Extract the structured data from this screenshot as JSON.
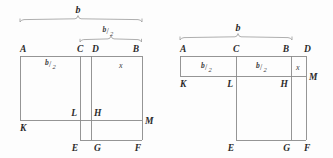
{
  "figure": {
    "background_color": "#fdfdfd",
    "line_color": "#8a8a8a",
    "text_color": "#2b2b2b"
  },
  "fraction": {
    "numerator": "b",
    "slash": "/",
    "denominator": "2"
  },
  "left_figure": {
    "name": "left-diagram",
    "dimension_brackets": [
      {
        "label": "b",
        "name": "bracket-b-full"
      },
      {
        "label": "b/2",
        "name": "bracket-b-half"
      }
    ],
    "inner_labels": [
      {
        "text": "b/2",
        "name": "label-b-half-inner"
      },
      {
        "text": "x",
        "name": "label-x"
      }
    ],
    "vertices": [
      {
        "text": "A",
        "name": "vertex-a"
      },
      {
        "text": "C",
        "name": "vertex-c"
      },
      {
        "text": "D",
        "name": "vertex-d"
      },
      {
        "text": "B",
        "name": "vertex-b"
      },
      {
        "text": "L",
        "name": "vertex-l"
      },
      {
        "text": "H",
        "name": "vertex-h"
      },
      {
        "text": "M",
        "name": "vertex-m"
      },
      {
        "text": "K",
        "name": "vertex-k"
      },
      {
        "text": "E",
        "name": "vertex-e"
      },
      {
        "text": "G",
        "name": "vertex-g"
      },
      {
        "text": "F",
        "name": "vertex-f"
      }
    ]
  },
  "right_figure": {
    "name": "right-diagram",
    "dimension_brackets": [
      {
        "label": "b",
        "name": "bracket-b-full"
      }
    ],
    "inner_labels": [
      {
        "text": "b/2",
        "name": "label-b-half-left"
      },
      {
        "text": "b/2",
        "name": "label-b-half-right"
      },
      {
        "text": "x",
        "name": "label-x"
      }
    ],
    "vertices": [
      {
        "text": "A",
        "name": "vertex-a"
      },
      {
        "text": "C",
        "name": "vertex-c"
      },
      {
        "text": "B",
        "name": "vertex-b"
      },
      {
        "text": "D",
        "name": "vertex-d"
      },
      {
        "text": "K",
        "name": "vertex-k"
      },
      {
        "text": "L",
        "name": "vertex-l"
      },
      {
        "text": "H",
        "name": "vertex-h"
      },
      {
        "text": "M",
        "name": "vertex-m"
      },
      {
        "text": "E",
        "name": "vertex-e"
      },
      {
        "text": "G",
        "name": "vertex-g"
      },
      {
        "text": "F",
        "name": "vertex-f"
      }
    ]
  }
}
